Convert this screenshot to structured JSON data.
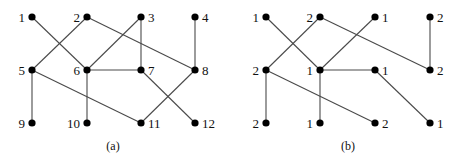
{
  "figure": {
    "panels": [
      {
        "id": "a",
        "caption": "(a)",
        "offset_x": 0,
        "nodes": [
          {
            "label": "1",
            "x": 32,
            "y": 17,
            "side": "left"
          },
          {
            "label": "2",
            "x": 87,
            "y": 17,
            "side": "left"
          },
          {
            "label": "3",
            "x": 141,
            "y": 17,
            "side": "right"
          },
          {
            "label": "4",
            "x": 195,
            "y": 17,
            "side": "right"
          },
          {
            "label": "5",
            "x": 32,
            "y": 70,
            "side": "left"
          },
          {
            "label": "6",
            "x": 87,
            "y": 70,
            "side": "left"
          },
          {
            "label": "7",
            "x": 141,
            "y": 70,
            "side": "right"
          },
          {
            "label": "8",
            "x": 195,
            "y": 70,
            "side": "right"
          },
          {
            "label": "9",
            "x": 32,
            "y": 123,
            "side": "left"
          },
          {
            "label": "10",
            "x": 87,
            "y": 123,
            "side": "left"
          },
          {
            "label": "11",
            "x": 141,
            "y": 123,
            "side": "right"
          },
          {
            "label": "12",
            "x": 195,
            "y": 123,
            "side": "right"
          }
        ],
        "edges": [
          [
            0,
            5
          ],
          [
            1,
            4
          ],
          [
            1,
            7
          ],
          [
            2,
            5
          ],
          [
            2,
            6
          ],
          [
            3,
            7
          ],
          [
            4,
            8
          ],
          [
            4,
            10
          ],
          [
            5,
            6
          ],
          [
            5,
            9
          ],
          [
            6,
            11
          ],
          [
            7,
            10
          ]
        ]
      },
      {
        "id": "b",
        "caption": "(b)",
        "offset_x": 0,
        "nodes": [
          {
            "label": "1",
            "x": 266,
            "y": 17,
            "side": "left"
          },
          {
            "label": "2",
            "x": 320,
            "y": 17,
            "side": "left"
          },
          {
            "label": "1",
            "x": 375,
            "y": 17,
            "side": "right"
          },
          {
            "label": "2",
            "x": 430,
            "y": 17,
            "side": "right"
          },
          {
            "label": "2",
            "x": 266,
            "y": 70,
            "side": "left"
          },
          {
            "label": "1",
            "x": 320,
            "y": 70,
            "side": "left"
          },
          {
            "label": "1",
            "x": 375,
            "y": 70,
            "side": "right"
          },
          {
            "label": "2",
            "x": 430,
            "y": 70,
            "side": "right"
          },
          {
            "label": "2",
            "x": 266,
            "y": 123,
            "side": "left"
          },
          {
            "label": "1",
            "x": 320,
            "y": 123,
            "side": "left"
          },
          {
            "label": "2",
            "x": 375,
            "y": 123,
            "side": "right"
          },
          {
            "label": "1",
            "x": 430,
            "y": 123,
            "side": "right"
          }
        ],
        "edges": [
          [
            0,
            5
          ],
          [
            1,
            4
          ],
          [
            1,
            7
          ],
          [
            2,
            5
          ],
          [
            3,
            7
          ],
          [
            4,
            8
          ],
          [
            4,
            10
          ],
          [
            5,
            6
          ],
          [
            5,
            9
          ],
          [
            6,
            11
          ]
        ]
      }
    ],
    "captions": {
      "a": "(a)",
      "b": "(b)"
    },
    "colors": {
      "node": "#000000",
      "edge": "#4a4a4a",
      "text": "#111111"
    }
  }
}
